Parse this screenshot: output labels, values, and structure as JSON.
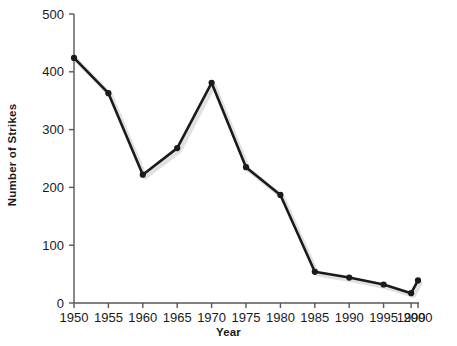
{
  "chart_data": {
    "type": "line",
    "title": "",
    "xlabel": "Year",
    "ylabel": "Number of Strikes",
    "xlim": [
      1950,
      2000
    ],
    "ylim": [
      0,
      500
    ],
    "grid": false,
    "legend": "none",
    "x_ticks": [
      1950,
      1955,
      1960,
      1965,
      1970,
      1975,
      1980,
      1985,
      1990,
      1995,
      1999,
      2000
    ],
    "x_tick_labels": [
      "1950",
      "1955",
      "1960",
      "1965",
      "1970",
      "1975",
      "1980",
      "1985",
      "1990",
      "1995",
      "1999",
      "2000"
    ],
    "y_ticks": [
      0,
      100,
      200,
      300,
      400,
      500
    ],
    "y_tick_labels": [
      "0",
      "100",
      "200",
      "300",
      "400",
      "500"
    ],
    "series": [
      {
        "name": "Number of Strikes",
        "color": "#1a1a1a",
        "marker": "circle",
        "x": [
          1950,
          1955,
          1960,
          1965,
          1970,
          1975,
          1980,
          1985,
          1990,
          1995,
          1999,
          2000
        ],
        "values": [
          424,
          363,
          222,
          268,
          381,
          235,
          187,
          54,
          44,
          32,
          17,
          39
        ]
      }
    ]
  },
  "style": {
    "line_color": "#1a1a1a",
    "axis_color": "#55565a",
    "background": "#ffffff"
  }
}
